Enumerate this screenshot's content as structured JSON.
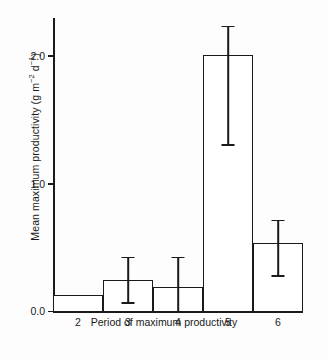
{
  "chart_data": {
    "type": "bar",
    "title": "",
    "xlabel": "Period of maximum productivity",
    "ylabel": "Mean maximum productivity (g m−2 d−1)",
    "ylabel_parts": {
      "prefix": "Mean maximum productivity (g m",
      "sup1": "−2",
      "mid": " d",
      "sup2": "−1",
      "suffix": ")"
    },
    "categories": [
      "2",
      "3",
      "4",
      "5",
      "6"
    ],
    "values": [
      0.12,
      0.23,
      0.18,
      2.0,
      0.52
    ],
    "errors_upper": [
      null,
      0.43,
      0.43,
      2.24,
      0.72
    ],
    "errors_lower": [
      null,
      0.06,
      0.0,
      1.3,
      0.27
    ],
    "ylim": [
      0.0,
      2.3
    ],
    "xlim": [
      1.5,
      6.5
    ],
    "ytick_labels": [
      "0.0",
      "1.0",
      "2.0"
    ],
    "ytick_values": [
      0.0,
      1.0,
      2.0
    ],
    "xtick_labels": [
      "2",
      "3",
      "4",
      "5",
      "6"
    ],
    "grid": false,
    "legend": null,
    "bar_face_color": "#ffffff",
    "bar_edge_color": "#1a1a1a",
    "axis_color": "#1a1a1a",
    "background_color": "#ffffff"
  }
}
